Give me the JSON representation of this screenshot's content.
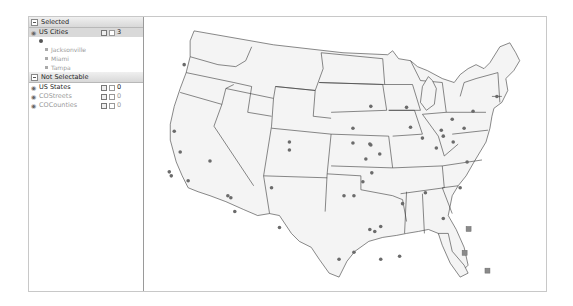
{
  "layer_panel": {
    "selected_section": {
      "label": "Selected"
    },
    "selected_layers": [
      {
        "name": "US Cities",
        "count": "3",
        "features": [
          {
            "label": "Jacksonville"
          },
          {
            "label": "Miami"
          },
          {
            "label": "Tampa"
          }
        ]
      }
    ],
    "not_selectable_section": {
      "label": "Not Selectable"
    },
    "other_layers": [
      {
        "name": "US States",
        "count": "0",
        "dim": false
      },
      {
        "name": "COStreets",
        "count": "0",
        "dim": true
      },
      {
        "name": "COCounties",
        "count": "0",
        "dim": true
      }
    ]
  },
  "map": {
    "colors": {
      "land": "#f4f4f4",
      "border": "#3a3a3a",
      "city": "#6b6b6b",
      "selected_city": "#8a8a8a"
    },
    "selected_cities": [
      "Jacksonville",
      "Tampa",
      "Miami"
    ]
  }
}
